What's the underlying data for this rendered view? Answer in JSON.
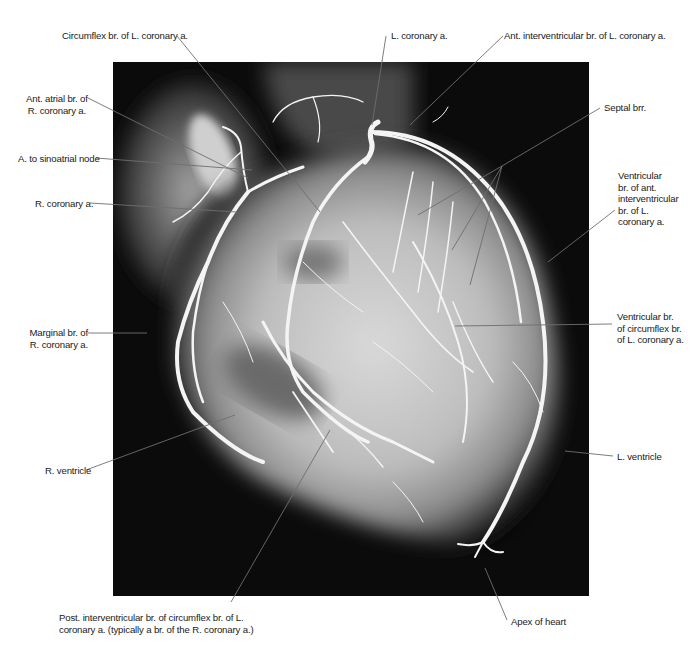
{
  "figure": {
    "type": "coronary angiogram",
    "background": "#0b0b0b",
    "vessel_color": "#f2f2f2",
    "leader_color": "#6e6e6e"
  },
  "labels": {
    "circumflex": {
      "lines": [
        "Circumflex br. of L. coronary a."
      ]
    },
    "l_coronary": {
      "lines": [
        "L. coronary a."
      ]
    },
    "ant_interventricular": {
      "lines": [
        "Ant. interventricular br. of L. coronary a."
      ]
    },
    "ant_atrial": {
      "lines": [
        "Ant. atrial br. of",
        "R. coronary a."
      ]
    },
    "sinoatrial": {
      "lines": [
        "A. to sinoatrial node"
      ]
    },
    "r_coronary": {
      "lines": [
        "R. coronary a."
      ]
    },
    "septal": {
      "lines": [
        "Septal brr."
      ]
    },
    "ventricular_ant": {
      "lines": [
        "Ventricular",
        "br. of ant.",
        "interventricular",
        "br. of L.",
        "coronary a."
      ]
    },
    "marginal": {
      "lines": [
        "Marginal br. of",
        "R. coronary a."
      ]
    },
    "ventricular_circ": {
      "lines": [
        "Ventricular br.",
        "of circumflex br.",
        "of L. coronary a."
      ]
    },
    "r_ventricle": {
      "lines": [
        "R. ventricle"
      ]
    },
    "l_ventricle": {
      "lines": [
        "L. ventricle"
      ]
    },
    "post_interventricular": {
      "lines": [
        "Post. interventricular br. of circumflex br. of L.",
        "coronary a. (typically a br. of the R. coronary a.)"
      ]
    },
    "apex": {
      "lines": [
        "Apex of heart"
      ]
    }
  }
}
